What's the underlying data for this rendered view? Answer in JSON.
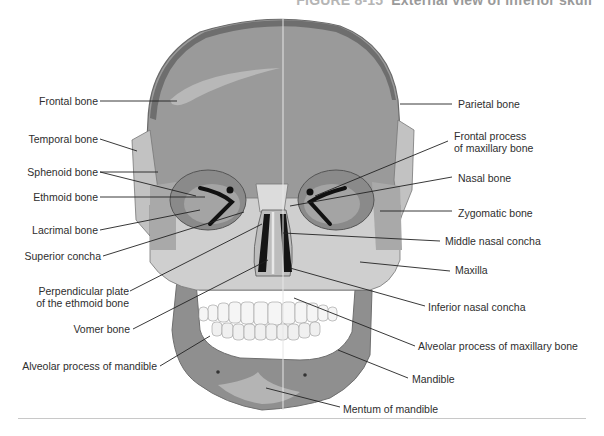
{
  "figure": {
    "number": "FIGURE 8-15",
    "title": "External view of inferior skull"
  },
  "labels_left": [
    {
      "id": "frontal",
      "text": "Frontal bone"
    },
    {
      "id": "temporal",
      "text": "Temporal bone"
    },
    {
      "id": "sphenoid",
      "text": "Sphenoid bone"
    },
    {
      "id": "ethmoid",
      "text": "Ethmoid bone"
    },
    {
      "id": "lacrimal",
      "text": "Lacrimal bone"
    },
    {
      "id": "superior-concha",
      "text": "Superior concha"
    },
    {
      "id": "perpendicular-plate",
      "line1": "Perpendicular plate",
      "line2": "of the ethmoid bone"
    },
    {
      "id": "vomer",
      "text": "Vomer bone"
    },
    {
      "id": "alveolar-mandible",
      "text": "Alveolar process of mandible"
    }
  ],
  "labels_right": [
    {
      "id": "parietal",
      "text": "Parietal bone"
    },
    {
      "id": "frontal-process",
      "line1": "Frontal process",
      "line2": "of maxillary bone"
    },
    {
      "id": "nasal",
      "text": "Nasal bone"
    },
    {
      "id": "zygomatic",
      "text": "Zygomatic bone"
    },
    {
      "id": "middle-concha",
      "text": "Middle nasal concha"
    },
    {
      "id": "maxilla",
      "text": "Maxilla"
    },
    {
      "id": "inferior-concha",
      "text": "Inferior nasal concha"
    },
    {
      "id": "alveolar-maxillary",
      "text": "Alveolar process of maxillary bone"
    },
    {
      "id": "mandible",
      "text": "Mandible"
    },
    {
      "id": "mentum",
      "text": "Mentum of mandible"
    }
  ],
  "colors": {
    "cranium": "#9e9e9e",
    "cranium_dark": "#7c7c7c",
    "bone_light": "#c9c9c9",
    "bone_pale": "#dcdcdc",
    "orbit": "#8e8e8e",
    "dark": "#1a1a1a",
    "teeth": "#f4f4f4",
    "leader": "#222222"
  }
}
